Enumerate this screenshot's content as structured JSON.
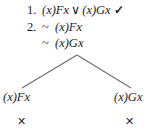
{
  "diagram": {
    "type": "truth-tree",
    "background_color": "#ffffff",
    "ink_color": "#1c1c1c",
    "line_color": "#6e6e6e"
  },
  "stack": [
    {
      "number": "1.",
      "negation": "",
      "formula_left": "(x)Fx",
      "operator": "∨",
      "formula_right": "(x)Gx",
      "check": "✓"
    },
    {
      "number": "2.",
      "negation": "~",
      "formula_left": "(x)Fx",
      "operator": "",
      "formula_right": "",
      "check": ""
    },
    {
      "number": "",
      "negation": "~",
      "formula_left": "(x)Gx",
      "operator": "",
      "formula_right": "",
      "check": ""
    }
  ],
  "branches": {
    "left": {
      "label": "(x)Fx",
      "closure_mark": "✕"
    },
    "right": {
      "label": "(x)Gx",
      "closure_mark": "✕"
    }
  },
  "branch_geometry": {
    "apex_x": 77,
    "apex_y": 55,
    "left_end_x": 22,
    "left_end_y": 88,
    "right_end_x": 131,
    "right_end_y": 88
  }
}
